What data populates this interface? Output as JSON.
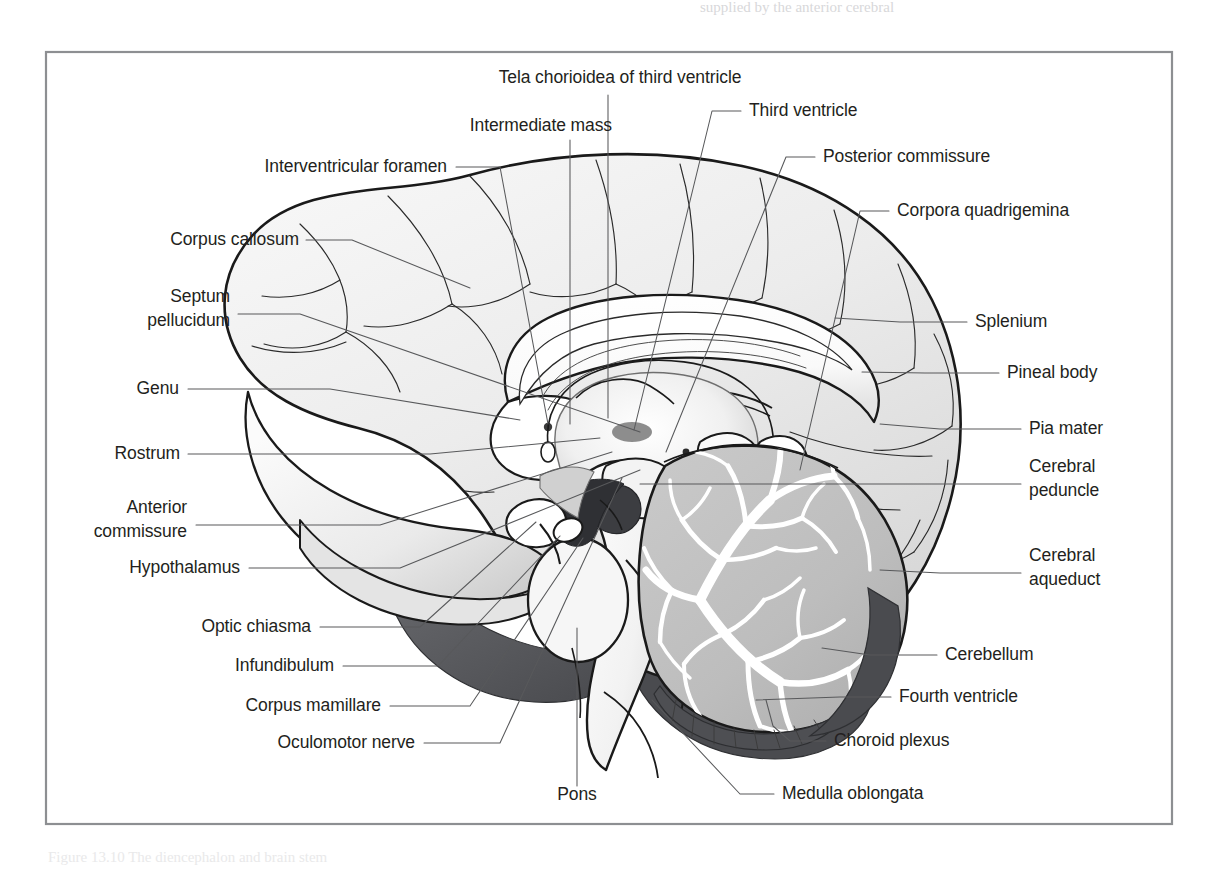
{
  "figure": {
    "frame": {
      "x": 46,
      "y": 52,
      "width": 1126,
      "height": 772,
      "border_color": "#8d8f92"
    },
    "page": {
      "width": 1216,
      "height": 871,
      "background": "#ffffff"
    },
    "partial_text_top": "supplied by the anterior cerebral",
    "partial_text_bottom": "Figure 13.10 The diencephalon and brain stem"
  },
  "style": {
    "label_color": "#231f20",
    "leader_color": "#58595b",
    "outline_color": "#1a1a1a",
    "cortex_fill": "#efefef",
    "cortex_shade": "#d9d9d9",
    "cerebellum_fill": "#c0c0c0",
    "cerebellum_arbor": "#ffffff",
    "dark_fill": "#55565a",
    "darker_fill": "#3b3c40",
    "ventricle_fill": "#ffffff",
    "label_font_size": 17.5
  },
  "labels": {
    "left": [
      {
        "id": "corpus-callosum",
        "text": "Corpus callosum",
        "x": 299,
        "y": 245,
        "anchor": "end"
      },
      {
        "id": "septum-pellucidum-1",
        "text": "Septum",
        "x": 230,
        "y": 302,
        "anchor": "end"
      },
      {
        "id": "septum-pellucidum-2",
        "text": "pellucidum",
        "x": 230,
        "y": 326,
        "anchor": "end"
      },
      {
        "id": "genu",
        "text": "Genu",
        "x": 179,
        "y": 394,
        "anchor": "end"
      },
      {
        "id": "rostrum",
        "text": "Rostrum",
        "x": 180,
        "y": 459,
        "anchor": "end"
      },
      {
        "id": "anterior-commissure-1",
        "text": "Anterior",
        "x": 187,
        "y": 513,
        "anchor": "end"
      },
      {
        "id": "anterior-commissure-2",
        "text": "commissure",
        "x": 187,
        "y": 537,
        "anchor": "end"
      },
      {
        "id": "hypothalamus",
        "text": "Hypothalamus",
        "x": 240,
        "y": 573,
        "anchor": "end"
      },
      {
        "id": "optic-chiasma",
        "text": "Optic chiasma",
        "x": 311,
        "y": 632,
        "anchor": "end"
      },
      {
        "id": "infundibulum",
        "text": "Infundibulum",
        "x": 334,
        "y": 671,
        "anchor": "end"
      },
      {
        "id": "corpus-mamillare",
        "text": "Corpus mamillare",
        "x": 381,
        "y": 711,
        "anchor": "end"
      },
      {
        "id": "oculomotor-nerve",
        "text": "Oculomotor nerve",
        "x": 415,
        "y": 748,
        "anchor": "end"
      }
    ],
    "top": [
      {
        "id": "tela-chorioidea",
        "text": "Tela chorioidea of third ventricle",
        "x": 620,
        "y": 83,
        "anchor": "middle"
      },
      {
        "id": "intermediate-mass",
        "text": "Intermediate mass",
        "x": 612,
        "y": 131,
        "anchor": "end"
      },
      {
        "id": "interventricular-foramen",
        "text": "Interventricular foramen",
        "x": 447,
        "y": 172,
        "anchor": "end"
      },
      {
        "id": "third-ventricle",
        "text": "Third ventricle",
        "x": 749,
        "y": 116,
        "anchor": "start"
      },
      {
        "id": "posterior-commissure",
        "text": "Posterior commissure",
        "x": 823,
        "y": 162,
        "anchor": "start"
      },
      {
        "id": "corpora-quadrigemina",
        "text": "Corpora quadrigemina",
        "x": 897,
        "y": 216,
        "anchor": "start"
      }
    ],
    "right": [
      {
        "id": "splenium",
        "text": "Splenium",
        "x": 975,
        "y": 327,
        "anchor": "start"
      },
      {
        "id": "pineal-body",
        "text": "Pineal body",
        "x": 1007,
        "y": 378,
        "anchor": "start"
      },
      {
        "id": "pia-mater",
        "text": "Pia mater",
        "x": 1029,
        "y": 434,
        "anchor": "start"
      },
      {
        "id": "cerebral-peduncle-1",
        "text": "Cerebral",
        "x": 1029,
        "y": 472,
        "anchor": "start"
      },
      {
        "id": "cerebral-peduncle-2",
        "text": "peduncle",
        "x": 1029,
        "y": 496,
        "anchor": "start"
      },
      {
        "id": "cerebral-aqueduct-1",
        "text": "Cerebral",
        "x": 1029,
        "y": 561,
        "anchor": "start"
      },
      {
        "id": "cerebral-aqueduct-2",
        "text": "aqueduct",
        "x": 1029,
        "y": 585,
        "anchor": "start"
      },
      {
        "id": "cerebellum",
        "text": "Cerebellum",
        "x": 945,
        "y": 660,
        "anchor": "start"
      },
      {
        "id": "fourth-ventricle",
        "text": "Fourth ventricle",
        "x": 899,
        "y": 702,
        "anchor": "start"
      },
      {
        "id": "choroid-plexus",
        "text": "Choroid plexus",
        "x": 834,
        "y": 746,
        "anchor": "start"
      },
      {
        "id": "medulla-oblongata",
        "text": "Medulla oblongata",
        "x": 782,
        "y": 799,
        "anchor": "start"
      }
    ],
    "bottom": [
      {
        "id": "pons",
        "text": "Pons",
        "x": 577,
        "y": 800,
        "anchor": "middle"
      }
    ]
  },
  "leaders": {
    "corpus-callosum": "M306,240 L352,240 L470,288",
    "septum-pellucidum": "M238,314 L300,314 L640,432",
    "genu": "M188,389 L330,389 L520,420",
    "rostrum": "M188,454 L430,454 L600,438",
    "anterior-commissure": "M196,525 L380,525 L612,452",
    "hypothalamus": "M249,568 L400,568 L640,470",
    "optic-chiasma": "M320,627 L420,627 L536,522",
    "infundibulum": "M343,666 L438,666 L560,536",
    "corpus-mamillare": "M390,706 L470,706 L583,538",
    "oculomotor-nerve": "M424,743 L500,743 L622,478",
    "tela-chorioidea": "M608,95 L608,418",
    "intermediate-mass": "M570,140 L570,424",
    "interventricular-foramen": "M456,167 L500,167 L548,424",
    "third-ventricle": "M741,111 L712,111 L634,430",
    "posterior-commissure": "M815,157 L786,157 L666,452",
    "corpora-quadrigemina": "M889,211 L860,211 L800,470",
    "splenium": "M967,322 L900,322 L835,318",
    "pineal-body": "M999,373 L925,373 L862,372",
    "pia-mater": "M1021,429 L940,429 L880,424",
    "cerebral-peduncle": "M1021,484 L900,484 L640,484",
    "cerebral-aqueduct": "M1021,573 L940,573 L880,570",
    "cerebellum": "M937,655 L870,655 L822,648",
    "fourth-ventricle": "M891,697 L840,697 L756,700",
    "choroid-plexus": "M826,741 L790,741 L773,726 L766,700",
    "medulla-oblongata": "M774,794 L740,794 L652,700",
    "pons": "M577,786 L577,628"
  },
  "structures": [
    {
      "id": "cerebrum",
      "name": "Cerebrum (cortex, medial surface)"
    },
    {
      "id": "corpus-callosum-body",
      "name": "Corpus callosum"
    },
    {
      "id": "lateral-ventricle",
      "name": "Lateral ventricle / septum pellucidum space"
    },
    {
      "id": "thalamus",
      "name": "Thalamus with intermediate mass"
    },
    {
      "id": "third-ventricle-space",
      "name": "Third ventricle"
    },
    {
      "id": "brainstem",
      "name": "Midbrain, pons, medulla oblongata"
    },
    {
      "id": "cerebellum-body",
      "name": "Cerebellum with arbor vitae"
    },
    {
      "id": "optic-chiasma-body",
      "name": "Optic chiasma and infundibulum"
    },
    {
      "id": "mamillary-body",
      "name": "Corpus mamillare"
    },
    {
      "id": "pineal-body-shape",
      "name": "Pineal body"
    }
  ]
}
